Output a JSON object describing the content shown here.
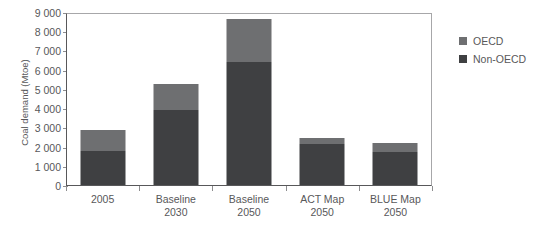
{
  "chart_data": {
    "type": "bar",
    "stacked": true,
    "title": "",
    "xlabel": "",
    "ylabel": "Coal demand (Mtoe)",
    "ylim": [
      0,
      9000
    ],
    "ytick_step": 1000,
    "ytick_labels": [
      "9 000",
      "8 000",
      "7 000",
      "6 000",
      "5 000",
      "4 000",
      "3 000",
      "2 000",
      "1 000",
      "0"
    ],
    "ytick_values": [
      9000,
      8000,
      7000,
      6000,
      5000,
      4000,
      3000,
      2000,
      1000,
      0
    ],
    "categories": [
      "2005",
      "Baseline 2030",
      "Baseline 2050",
      "ACT Map 2050",
      "BLUE Map 2050"
    ],
    "category_lines": [
      [
        "2005"
      ],
      [
        "Baseline",
        "2030"
      ],
      [
        "Baseline",
        "2050"
      ],
      [
        "ACT Map",
        "2050"
      ],
      [
        "BLUE Map",
        "2050"
      ]
    ],
    "series": [
      {
        "name": "Non-OECD",
        "color": "#3f4042",
        "values": [
          1750,
          3900,
          6400,
          2150,
          1700
        ]
      },
      {
        "name": "OECD",
        "color": "#6e6f71",
        "values": [
          1100,
          1350,
          2250,
          300,
          500
        ]
      }
    ],
    "totals": [
      2850,
      5250,
      8650,
      2450,
      2200
    ],
    "legend_position": "right",
    "grid": false
  },
  "legend": {
    "items": [
      {
        "label": "OECD",
        "color": "#6e6f71"
      },
      {
        "label": "Non-OECD",
        "color": "#3f4042"
      }
    ]
  },
  "title_remnant": "",
  "colors": {
    "oecd": "#6e6f71",
    "non_oecd": "#3f4042",
    "axis": "#58585a",
    "frame": "#a7a7a9",
    "background": "#ffffff"
  }
}
